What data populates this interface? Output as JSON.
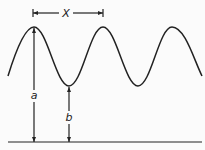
{
  "diagram": {
    "title": "",
    "labels": {
      "wavelength": "X",
      "peak_height": "a",
      "trough_height": "b"
    },
    "wave": {
      "type": "sine",
      "peaks_x": [
        34,
        103,
        172
      ],
      "troughs_x": [
        69,
        138
      ],
      "peak_y": 27,
      "trough_y": 86,
      "baseline_y": 142
    },
    "colors": {
      "stroke": "#222222",
      "background": "#fbfbfb"
    }
  }
}
